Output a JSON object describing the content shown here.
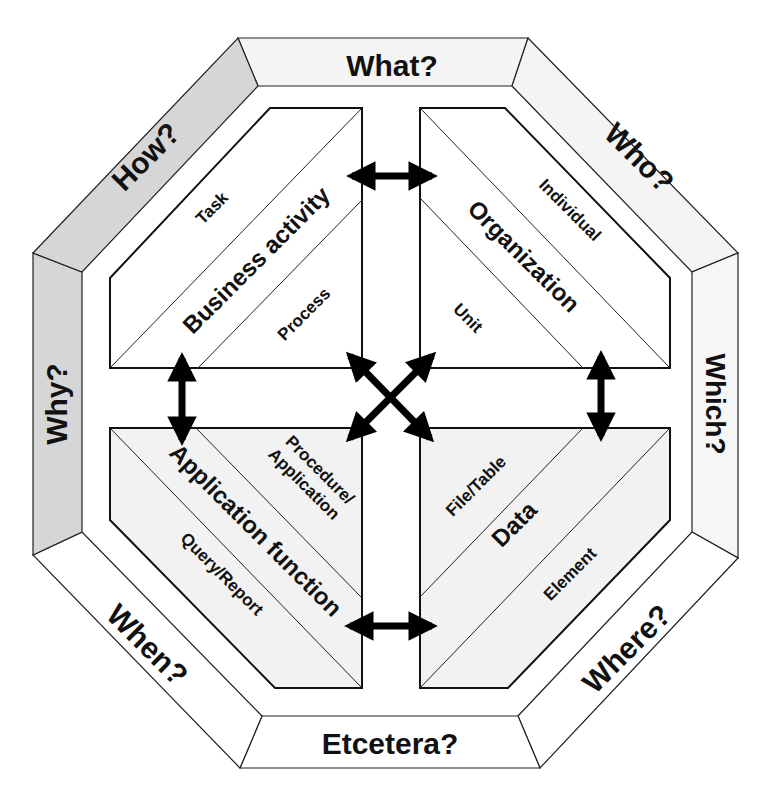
{
  "diagram": {
    "frame_labels": {
      "top": "What?",
      "top_right": "Who?",
      "right": "Which?",
      "bottom_right": "Where?",
      "bottom": "Etcetera?",
      "bottom_left": "When?",
      "left": "Why?",
      "top_left": "How?"
    },
    "quadrants": {
      "top_left": {
        "title": "Business activity",
        "upper": "Task",
        "lower": "Process"
      },
      "top_right": {
        "title": "Organization",
        "upper": "Individual",
        "lower": "Unit"
      },
      "bottom_left": {
        "title": "Application function",
        "upper": "Procedure/",
        "upper2": "Application",
        "lower": "Query/Report"
      },
      "bottom_right": {
        "title": "Data",
        "upper": "File/Table",
        "lower": "Element"
      }
    },
    "colors": {
      "shaded_frame": "#d6d6d6",
      "light_frame": "#f4f4f4",
      "white": "#ffffff",
      "lower_quadrant_fill": "#f2f2f2",
      "ink": "#111111"
    }
  }
}
